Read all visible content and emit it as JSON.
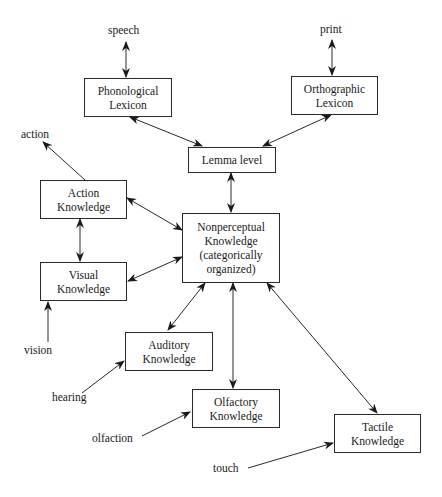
{
  "diagram": {
    "nodes": {
      "phonological": {
        "line1": "Phonological",
        "line2": "Lexicon"
      },
      "orthographic": {
        "line1": "Orthographic",
        "line2": "Lexicon"
      },
      "lemma": {
        "line1": "Lemma level"
      },
      "nonperceptual": {
        "line1": "Nonperceptual",
        "line2": "Knowledge",
        "line3": "(categorically",
        "line4": "organized)"
      },
      "action": {
        "line1": "Action",
        "line2": "Knowledge"
      },
      "visual": {
        "line1": "Visual",
        "line2": "Knowledge"
      },
      "auditory": {
        "line1": "Auditory",
        "line2": "Knowledge"
      },
      "olfactory": {
        "line1": "Olfactory",
        "line2": "Knowledge"
      },
      "tactile": {
        "line1": "Tactile",
        "line2": "Knowledge"
      }
    },
    "labels": {
      "speech": "speech",
      "print": "print",
      "action": "action",
      "vision": "vision",
      "hearing": "hearing",
      "olfaction": "olfaction",
      "touch": "touch"
    },
    "edges": [
      {
        "from": "speech",
        "to": "Phonological Lexicon",
        "type": "bidirectional"
      },
      {
        "from": "print",
        "to": "Orthographic Lexicon",
        "type": "bidirectional"
      },
      {
        "from": "Phonological Lexicon",
        "to": "Lemma level",
        "type": "bidirectional"
      },
      {
        "from": "Orthographic Lexicon",
        "to": "Lemma level",
        "type": "bidirectional"
      },
      {
        "from": "Lemma level",
        "to": "Nonperceptual Knowledge",
        "type": "bidirectional"
      },
      {
        "from": "Action Knowledge",
        "to": "action",
        "type": "directed"
      },
      {
        "from": "Action Knowledge",
        "to": "Nonperceptual Knowledge",
        "type": "bidirectional"
      },
      {
        "from": "Action Knowledge",
        "to": "Visual Knowledge",
        "type": "bidirectional"
      },
      {
        "from": "Visual Knowledge",
        "to": "Nonperceptual Knowledge",
        "type": "bidirectional"
      },
      {
        "from": "vision",
        "to": "Visual Knowledge",
        "type": "directed"
      },
      {
        "from": "Auditory Knowledge",
        "to": "Nonperceptual Knowledge",
        "type": "bidirectional"
      },
      {
        "from": "hearing",
        "to": "Auditory Knowledge",
        "type": "directed"
      },
      {
        "from": "Olfactory Knowledge",
        "to": "Nonperceptual Knowledge",
        "type": "bidirectional"
      },
      {
        "from": "olfaction",
        "to": "Olfactory Knowledge",
        "type": "directed"
      },
      {
        "from": "Tactile Knowledge",
        "to": "Nonperceptual Knowledge",
        "type": "bidirectional"
      },
      {
        "from": "touch",
        "to": "Tactile Knowledge",
        "type": "directed"
      }
    ],
    "line_color": "#2a2a2a"
  }
}
